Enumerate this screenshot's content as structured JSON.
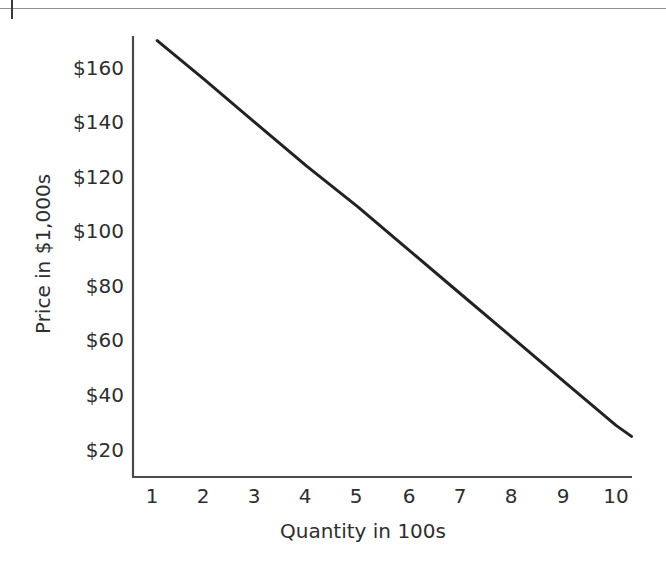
{
  "page": {
    "background_color": "#ffffff",
    "rule_color": "#8f8f92",
    "crop_tick_name": "page-crop-tick"
  },
  "chart_data": {
    "type": "line",
    "title": "",
    "subtitle": "",
    "xlabel": "Quantity in 100s",
    "ylabel": "Price in $1,000s",
    "xlim": [
      0.6,
      10.7
    ],
    "ylim": [
      10,
      175
    ],
    "xticks": [
      1,
      2,
      3,
      4,
      5,
      6,
      7,
      8,
      9,
      10
    ],
    "xtick_labels": [
      "1",
      "2",
      "3",
      "4",
      "5",
      "6",
      "7",
      "8",
      "9",
      "10"
    ],
    "yticks": [
      20,
      40,
      60,
      80,
      100,
      120,
      140,
      160
    ],
    "ytick_labels": [
      "$20",
      "$40",
      "$60",
      "$80",
      "$100",
      "$120",
      "$140",
      "$160"
    ],
    "grid": false,
    "legend": null,
    "legend_position": "none",
    "axis_color": "#4a4a4c",
    "line_color": "#222222",
    "line_width": 3,
    "series": [
      {
        "name": "Demand",
        "x": [
          1.1,
          2,
          3,
          4,
          5,
          6,
          7,
          8,
          9,
          10,
          10.3
        ],
        "values": [
          170,
          156,
          140,
          124,
          109,
          93,
          77,
          61,
          45,
          29,
          25
        ]
      }
    ],
    "annotations": []
  }
}
